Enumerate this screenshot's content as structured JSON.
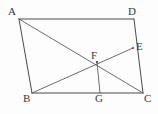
{
  "figure": {
    "background_color": "#fdfdfd",
    "line_color": "#4a4a4a",
    "label_color": "#3a3a3a",
    "width": 158,
    "height": 114
  },
  "diagram_data": {
    "type": "geometry",
    "shape": "parallelogram",
    "points": [
      {
        "id": "A",
        "label": "A",
        "x": 19,
        "y": 19,
        "label_x": 8,
        "label_y": 6
      },
      {
        "id": "D",
        "label": "D",
        "x": 134,
        "y": 19,
        "label_x": 128,
        "label_y": 6
      },
      {
        "id": "E",
        "label": "E",
        "x": 133,
        "y": 48,
        "label_x": 136,
        "label_y": 41
      },
      {
        "id": "F",
        "label": "F",
        "x": 97,
        "y": 62,
        "label_x": 91,
        "label_y": 50
      },
      {
        "id": "B",
        "label": "B",
        "x": 32,
        "y": 93,
        "label_x": 23,
        "label_y": 93
      },
      {
        "id": "G",
        "label": "G",
        "x": 100,
        "y": 93,
        "label_x": 95,
        "label_y": 93
      },
      {
        "id": "C",
        "label": "C",
        "x": 143,
        "y": 93,
        "label_x": 144,
        "label_y": 93
      }
    ],
    "segments": [
      {
        "id": "AD",
        "from": "A",
        "to": "D",
        "style": "solid"
      },
      {
        "id": "AB",
        "from": "A",
        "to": "B",
        "style": "solid"
      },
      {
        "id": "BC",
        "from": "B",
        "to": "C",
        "style": "solid"
      },
      {
        "id": "DC",
        "from": "D",
        "to": "C",
        "style": "solid"
      },
      {
        "id": "AC",
        "from": "A",
        "to": "C",
        "style": "solid"
      },
      {
        "id": "BE",
        "from": "B",
        "to": "E",
        "style": "solid"
      },
      {
        "id": "FG",
        "from": "F",
        "to": "G",
        "style": "solid"
      }
    ],
    "labels": [
      "A",
      "D",
      "E",
      "F",
      "B",
      "G",
      "C"
    ]
  }
}
